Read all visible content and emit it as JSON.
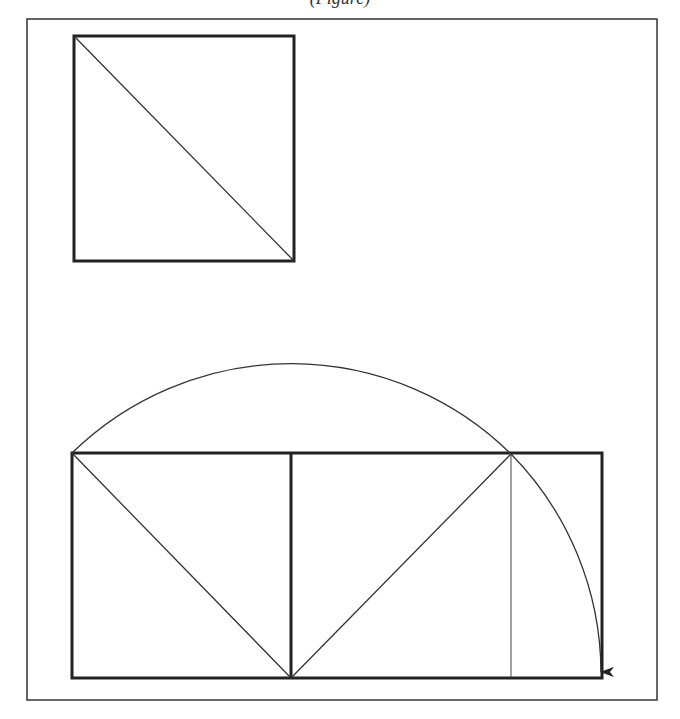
{
  "caption": {
    "text": "(Figure)"
  },
  "colors": {
    "stroke": "#222222",
    "background": "#ffffff"
  },
  "diagram": {
    "frame": {
      "x1": 27,
      "y1": 19,
      "x2": 657,
      "y2": 700
    },
    "top_square": {
      "x": 74,
      "y": 36,
      "size": 220,
      "diagonal": "top-left to bottom-right"
    },
    "bottom_construction": {
      "rectangle": {
        "x1": 72,
        "y1": 453,
        "x2": 602,
        "y2": 678
      },
      "divider_x": 291,
      "arc_center": [
        291,
        678
      ],
      "arc_radius": 313,
      "golden_point_x": 511,
      "arrow_end": [
        601,
        678
      ]
    }
  }
}
